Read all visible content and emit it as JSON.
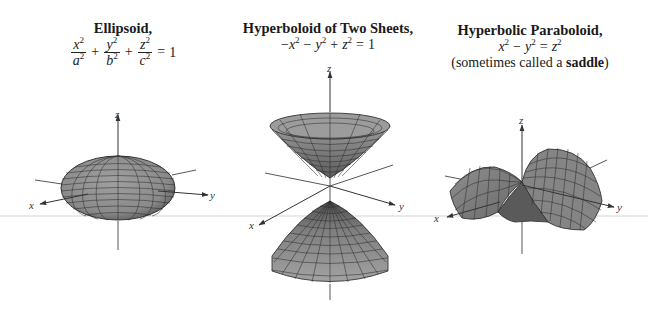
{
  "figures": [
    {
      "id": "ellipsoid",
      "title": "Ellipsoid,",
      "equation": {
        "terms": [
          {
            "num_var": "x",
            "den_var": "a",
            "exp": "2"
          },
          {
            "num_var": "y",
            "den_var": "b",
            "exp": "2"
          },
          {
            "num_var": "z",
            "den_var": "c",
            "exp": "2"
          }
        ],
        "plus": "+",
        "equals": "=",
        "rhs": "1"
      },
      "axes": {
        "x": "x",
        "y": "y",
        "z": "z"
      }
    },
    {
      "id": "hyperboloid-two-sheets",
      "title": "Hyperboloid of Two Sheets,",
      "equation": {
        "lead_minus": "−",
        "x": "x",
        "y": "y",
        "z": "z",
        "exp": "2",
        "minus": "−",
        "plus": "+",
        "equals": "=",
        "rhs": "1"
      },
      "axes": {
        "x": "x",
        "y": "y",
        "z": "z"
      }
    },
    {
      "id": "hyperbolic-paraboloid",
      "title": "Hyperbolic Paraboloid,",
      "equation": {
        "x": "x",
        "y": "y",
        "z": "z",
        "exp": "2",
        "minus": "−",
        "equals": "="
      },
      "note_prefix": "(sometimes called a ",
      "note_bold": "saddle",
      "note_suffix": ")",
      "axes": {
        "x": "x",
        "y": "y",
        "z": "z"
      }
    }
  ],
  "colors": {
    "surface_fill": "#8c8c8c",
    "surface_dark": "#5e5e5e",
    "grid_line": "#2a2a2a",
    "axis": "#333333",
    "ground_line": "#d4d4d4"
  }
}
